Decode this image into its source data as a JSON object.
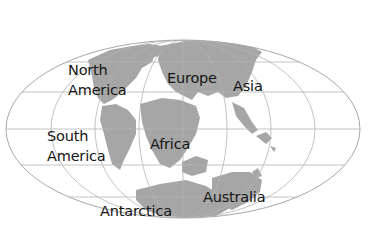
{
  "map": {
    "projection": "elliptical world map (Mollweide-style)",
    "colors": {
      "background": "#ffffff",
      "land": "#a6a6a6",
      "grid": "#b4b4b4",
      "label": "#141414"
    },
    "labels": {
      "north_america": [
        "North",
        "America"
      ],
      "south_america": [
        "South",
        "America"
      ],
      "europe": "Europe",
      "asia": "Asia",
      "africa": "Africa",
      "antarctica": "Antarctica",
      "australia": "Australia"
    }
  }
}
